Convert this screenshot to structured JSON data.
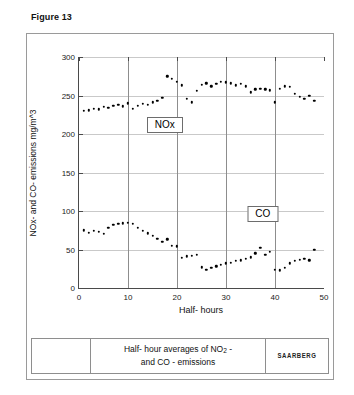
{
  "figure": {
    "title": "Figure 13"
  },
  "caption": {
    "line1": "Half- hour averages of NO",
    "line1_sub": "2",
    "line1_tail": " -",
    "line2": "and CO - emissions",
    "logo": "SAARBERG"
  },
  "chart_data": {
    "type": "scatter",
    "title": "",
    "xlabel": "Half- hours",
    "ylabel": "NOx- and CO- emissions   mg/m^3",
    "xlim": [
      0,
      50
    ],
    "ylim": [
      0,
      300
    ],
    "xticks": [
      0,
      10,
      20,
      30,
      40,
      50
    ],
    "yticks": [
      0,
      50,
      100,
      150,
      200,
      250,
      300
    ],
    "grid": "both",
    "legend_position": "inline-boxes",
    "series": [
      {
        "name": "NOx",
        "label_box": "NOx",
        "label_x": 17.5,
        "label_y": 212,
        "x": [
          1,
          2,
          3,
          4,
          5,
          6,
          7,
          8,
          9,
          10,
          11,
          12,
          13,
          14,
          15,
          16,
          17,
          18,
          19,
          20,
          21,
          22,
          23,
          24,
          25,
          26,
          27,
          28,
          29,
          30,
          31,
          32,
          33,
          34,
          35,
          36,
          37,
          38,
          39,
          40,
          41,
          42,
          43,
          44,
          45,
          46,
          47,
          48
        ],
        "y": [
          230,
          231,
          233,
          232,
          235,
          234,
          237,
          238,
          236,
          240,
          233,
          237,
          239,
          238,
          241,
          243,
          247,
          275,
          272,
          268,
          263,
          246,
          241,
          256,
          264,
          266,
          262,
          265,
          268,
          267,
          266,
          263,
          265,
          262,
          254,
          258,
          259,
          258,
          257,
          241,
          259,
          262,
          261,
          252,
          248,
          246,
          250,
          243
        ]
      },
      {
        "name": "CO",
        "label_box": "CO",
        "label_x": 37.5,
        "label_y": 96,
        "x": [
          1,
          2,
          3,
          4,
          5,
          6,
          7,
          8,
          9,
          10,
          11,
          12,
          13,
          14,
          15,
          16,
          17,
          18,
          19,
          20,
          21,
          22,
          23,
          24,
          25,
          26,
          27,
          28,
          29,
          30,
          31,
          32,
          33,
          34,
          35,
          36,
          37,
          38,
          39,
          40,
          41,
          42,
          43,
          44,
          45,
          46,
          47,
          48
        ],
        "y": [
          75,
          72,
          74,
          73,
          70,
          78,
          82,
          83,
          84,
          85,
          83,
          78,
          74,
          71,
          68,
          64,
          60,
          63,
          55,
          54,
          39,
          41,
          42,
          43,
          27,
          24,
          26,
          28,
          30,
          32,
          33,
          35,
          36,
          38,
          40,
          45,
          52,
          43,
          47,
          24,
          23,
          26,
          32,
          35,
          37,
          38,
          36,
          50
        ]
      }
    ]
  }
}
